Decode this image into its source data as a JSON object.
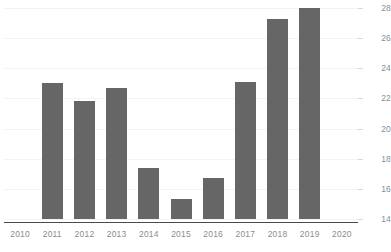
{
  "chart_data": {
    "type": "bar",
    "title": "",
    "subtitle": "",
    "xlabel": "",
    "ylabel": "",
    "categories": [
      "2010",
      "2011",
      "2012",
      "2013",
      "2014",
      "2015",
      "2016",
      "2017",
      "2018",
      "2019",
      "2020"
    ],
    "values": [
      null,
      23.0,
      21.8,
      22.7,
      17.4,
      15.3,
      16.7,
      23.1,
      27.3,
      28.0,
      null
    ],
    "series": [
      {
        "name": "",
        "values": [
          null,
          23.0,
          21.8,
          22.7,
          17.4,
          15.3,
          16.7,
          23.1,
          27.3,
          28.0,
          null
        ]
      }
    ],
    "ylim": [
      14,
      28
    ],
    "xlim": [
      "2010",
      "2020"
    ],
    "yticks": [
      14,
      16,
      18,
      20,
      22,
      24,
      26,
      28
    ],
    "ytick_labels": [
      "14",
      "16",
      "18",
      "20",
      "22",
      "24",
      "26",
      "28"
    ],
    "xtick_labels": [
      "2010",
      "2011",
      "2012",
      "2013",
      "2014",
      "2015",
      "2016",
      "2017",
      "2018",
      "2019",
      "2020"
    ],
    "grid": true,
    "grid_axis": "y",
    "legend": false,
    "legend_position": "none",
    "y_axis_position": "right",
    "annotations": []
  },
  "style": {
    "bar_color": "#666666",
    "gridline_color": "#f4f4f5",
    "baseline_color": "#4a4a4a",
    "tick_label_color": "#8d8d8d",
    "background": "#ffffff"
  }
}
